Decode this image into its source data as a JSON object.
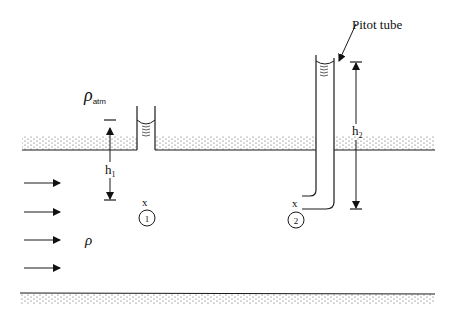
{
  "diagram": {
    "type": "fluid-flow-pitot-piezometer",
    "labels": {
      "pitot_tube": "Pitot tube",
      "rho_atm_symbol": "ρ",
      "rho_atm_subscript": "atm",
      "rho_fluid": "ρ",
      "h1_base": "h",
      "h1_sub": "1",
      "h2_base": "h",
      "h2_sub": "2",
      "point1_mark": "x",
      "point1_number": "1",
      "point2_mark": "x",
      "point2_number": "2"
    },
    "flow_arrows": [
      {
        "y": 183
      },
      {
        "y": 212
      },
      {
        "y": 240
      },
      {
        "y": 268
      }
    ],
    "colors": {
      "line": "#1a1a1a",
      "stipple": "#555555",
      "background": "#ffffff"
    }
  }
}
